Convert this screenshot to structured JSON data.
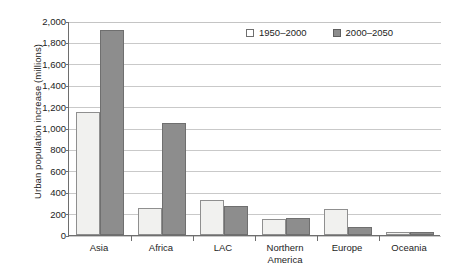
{
  "chart_data": {
    "type": "bar",
    "title": "",
    "subtitle": "",
    "xlabel": "",
    "ylabel": "Urban population increase (millions)",
    "categories": [
      "Asia",
      "Africa",
      "LAC",
      "Northern America",
      "Europe",
      "Oceania"
    ],
    "category_label_lines": [
      [
        "Asia"
      ],
      [
        "Africa"
      ],
      [
        "LAC"
      ],
      [
        "Northern",
        "America"
      ],
      [
        "Europe"
      ],
      [
        "Oceania"
      ]
    ],
    "series": [
      {
        "name": "1950–2000",
        "color": "#f1f1ef",
        "values": [
          1150,
          255,
          325,
          150,
          240,
          25
        ]
      },
      {
        "name": "2000–2050",
        "color": "#8d8d8d",
        "values": [
          1920,
          1050,
          270,
          155,
          75,
          30
        ]
      }
    ],
    "ylim": [
      0,
      2000
    ],
    "ytick_step": 200,
    "ytick_labels": [
      "2,000",
      "1,800",
      "1,600",
      "1,400",
      "1,200",
      "1,000",
      "800",
      "600",
      "400",
      "200",
      "0"
    ],
    "ytick_values": [
      2000,
      1800,
      1600,
      1400,
      1200,
      1000,
      800,
      600,
      400,
      200,
      0
    ],
    "grid": true,
    "grid_axis": "y",
    "legend_position": "top-right-inside",
    "annotations": []
  },
  "legend": {
    "items": [
      {
        "label": "1950–2000",
        "swatch": "series-a-swatch"
      },
      {
        "label": "2000–2050",
        "swatch": "series-b-swatch"
      }
    ]
  },
  "colors": {
    "series_a_fill": "#f1f1ef",
    "series_a_border": "#8f8f8f",
    "series_b_fill": "#8d8d8d",
    "series_b_border": "#6f6f6f",
    "gridline": "#c9c9c9",
    "axis": "#6e6e6e",
    "text": "#1d1d1d",
    "background": "#ffffff"
  }
}
